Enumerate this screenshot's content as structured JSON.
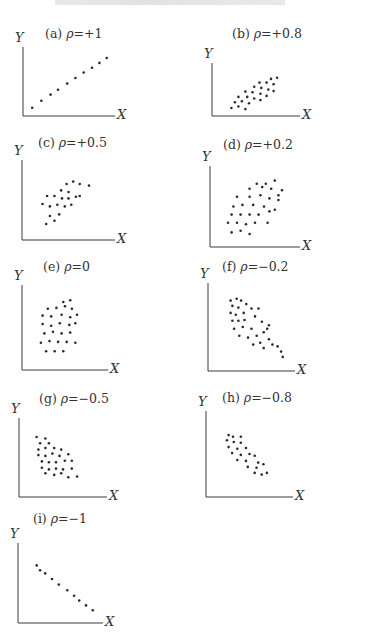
{
  "page": {
    "header_text_visible": false
  },
  "chart_data": [
    {
      "id": "a",
      "type": "scatter",
      "label_prefix": "(a)",
      "rho_symbol": "ρ",
      "rho_value": "=+1",
      "title": "(a) ρ=+1",
      "xlabel": "X",
      "ylabel": "Y",
      "grid": false,
      "ticks": false,
      "layout": {
        "left": 23,
        "top": 47,
        "axisW": 92,
        "axisH": 69,
        "labelX": 45,
        "labelY": 26
      },
      "points": [
        [
          0.1,
          0.12
        ],
        [
          0.2,
          0.22
        ],
        [
          0.3,
          0.31
        ],
        [
          0.38,
          0.38
        ],
        [
          0.48,
          0.47
        ],
        [
          0.57,
          0.55
        ],
        [
          0.66,
          0.63
        ],
        [
          0.75,
          0.7
        ],
        [
          0.83,
          0.77
        ],
        [
          0.91,
          0.84
        ]
      ]
    },
    {
      "id": "b",
      "type": "scatter",
      "label_prefix": "(b)",
      "rho_symbol": "ρ",
      "rho_value": "=+0.8",
      "title": "(b) ρ=+0.8",
      "xlabel": "X",
      "ylabel": "Y",
      "grid": false,
      "ticks": false,
      "layout": {
        "left": 212,
        "top": 63,
        "axisW": 88,
        "axisH": 53,
        "labelX": 232,
        "labelY": 26
      },
      "points": [
        [
          0.22,
          0.15
        ],
        [
          0.3,
          0.18
        ],
        [
          0.38,
          0.13
        ],
        [
          0.26,
          0.26
        ],
        [
          0.34,
          0.28
        ],
        [
          0.42,
          0.24
        ],
        [
          0.3,
          0.36
        ],
        [
          0.4,
          0.36
        ],
        [
          0.48,
          0.33
        ],
        [
          0.55,
          0.3
        ],
        [
          0.38,
          0.46
        ],
        [
          0.46,
          0.45
        ],
        [
          0.55,
          0.42
        ],
        [
          0.62,
          0.38
        ],
        [
          0.48,
          0.55
        ],
        [
          0.56,
          0.53
        ],
        [
          0.64,
          0.5
        ],
        [
          0.7,
          0.47
        ],
        [
          0.54,
          0.63
        ],
        [
          0.62,
          0.63
        ],
        [
          0.7,
          0.6
        ],
        [
          0.67,
          0.7
        ],
        [
          0.74,
          0.72
        ]
      ]
    },
    {
      "id": "c",
      "type": "scatter",
      "label_prefix": "(c)",
      "rho_symbol": "ρ",
      "rho_value": "=+0.5",
      "title": "(c) ρ=+0.5",
      "xlabel": "X",
      "ylabel": "Y",
      "grid": false,
      "ticks": false,
      "layout": {
        "left": 22,
        "top": 160,
        "axisW": 93,
        "axisH": 80,
        "labelX": 38,
        "labelY": 135
      },
      "points": [
        [
          0.26,
          0.2
        ],
        [
          0.35,
          0.24
        ],
        [
          0.3,
          0.3
        ],
        [
          0.4,
          0.32
        ],
        [
          0.22,
          0.45
        ],
        [
          0.3,
          0.42
        ],
        [
          0.38,
          0.44
        ],
        [
          0.46,
          0.42
        ],
        [
          0.53,
          0.44
        ],
        [
          0.27,
          0.55
        ],
        [
          0.35,
          0.55
        ],
        [
          0.43,
          0.52
        ],
        [
          0.5,
          0.52
        ],
        [
          0.58,
          0.54
        ],
        [
          0.42,
          0.62
        ],
        [
          0.5,
          0.6
        ],
        [
          0.62,
          0.55
        ],
        [
          0.48,
          0.7
        ],
        [
          0.55,
          0.73
        ],
        [
          0.62,
          0.7
        ],
        [
          0.72,
          0.68
        ]
      ]
    },
    {
      "id": "d",
      "type": "scatter",
      "label_prefix": "(d)",
      "rho_symbol": "ρ",
      "rho_value": "=+0.2",
      "title": "(d) ρ=+0.2",
      "xlabel": "X",
      "ylabel": "Y",
      "grid": false,
      "ticks": false,
      "layout": {
        "left": 210,
        "top": 166,
        "axisW": 90,
        "axisH": 81,
        "labelX": 223,
        "labelY": 137
      },
      "points": [
        [
          0.24,
          0.18
        ],
        [
          0.34,
          0.2
        ],
        [
          0.44,
          0.16
        ],
        [
          0.2,
          0.3
        ],
        [
          0.3,
          0.3
        ],
        [
          0.4,
          0.28
        ],
        [
          0.5,
          0.3
        ],
        [
          0.64,
          0.3
        ],
        [
          0.24,
          0.4
        ],
        [
          0.34,
          0.4
        ],
        [
          0.44,
          0.4
        ],
        [
          0.54,
          0.4
        ],
        [
          0.66,
          0.44
        ],
        [
          0.26,
          0.5
        ],
        [
          0.36,
          0.52
        ],
        [
          0.48,
          0.52
        ],
        [
          0.6,
          0.5
        ],
        [
          0.72,
          0.46
        ],
        [
          0.3,
          0.62
        ],
        [
          0.44,
          0.62
        ],
        [
          0.56,
          0.64
        ],
        [
          0.66,
          0.6
        ],
        [
          0.76,
          0.58
        ],
        [
          0.44,
          0.72
        ],
        [
          0.58,
          0.74
        ],
        [
          0.68,
          0.72
        ],
        [
          0.76,
          0.64
        ],
        [
          0.52,
          0.78
        ],
        [
          0.62,
          0.78
        ],
        [
          0.72,
          0.82
        ],
        [
          0.8,
          0.7
        ]
      ]
    },
    {
      "id": "e",
      "type": "scatter",
      "label_prefix": "(e)",
      "rho_symbol": "ρ",
      "rho_value": "=0",
      "title": "(e) ρ=0",
      "xlabel": "X",
      "ylabel": "Y",
      "grid": false,
      "ticks": false,
      "layout": {
        "left": 22,
        "top": 285,
        "axisW": 86,
        "axisH": 85,
        "labelX": 43,
        "labelY": 259
      },
      "points": [
        [
          0.28,
          0.22
        ],
        [
          0.38,
          0.22
        ],
        [
          0.48,
          0.22
        ],
        [
          0.22,
          0.32
        ],
        [
          0.32,
          0.34
        ],
        [
          0.42,
          0.33
        ],
        [
          0.52,
          0.33
        ],
        [
          0.62,
          0.32
        ],
        [
          0.26,
          0.43
        ],
        [
          0.36,
          0.45
        ],
        [
          0.46,
          0.43
        ],
        [
          0.56,
          0.44
        ],
        [
          0.24,
          0.54
        ],
        [
          0.34,
          0.52
        ],
        [
          0.44,
          0.55
        ],
        [
          0.55,
          0.53
        ],
        [
          0.62,
          0.55
        ],
        [
          0.24,
          0.64
        ],
        [
          0.34,
          0.63
        ],
        [
          0.46,
          0.65
        ],
        [
          0.56,
          0.62
        ],
        [
          0.64,
          0.65
        ],
        [
          0.3,
          0.72
        ],
        [
          0.4,
          0.73
        ],
        [
          0.5,
          0.75
        ],
        [
          0.58,
          0.72
        ],
        [
          0.48,
          0.8
        ],
        [
          0.56,
          0.82
        ]
      ]
    },
    {
      "id": "f",
      "type": "scatter",
      "label_prefix": "(f)",
      "rho_symbol": "ρ",
      "rho_value": "=−0.2",
      "title": "(f) ρ=−0.2",
      "xlabel": "X",
      "ylabel": "Y",
      "grid": false,
      "ticks": false,
      "layout": {
        "left": 208,
        "top": 283,
        "axisW": 87,
        "axisH": 88,
        "labelX": 222,
        "labelY": 259
      },
      "points": [
        [
          0.26,
          0.8
        ],
        [
          0.33,
          0.82
        ],
        [
          0.38,
          0.8
        ],
        [
          0.28,
          0.74
        ],
        [
          0.35,
          0.72
        ],
        [
          0.44,
          0.76
        ],
        [
          0.26,
          0.66
        ],
        [
          0.32,
          0.64
        ],
        [
          0.41,
          0.66
        ],
        [
          0.5,
          0.71
        ],
        [
          0.58,
          0.71
        ],
        [
          0.28,
          0.57
        ],
        [
          0.35,
          0.57
        ],
        [
          0.42,
          0.58
        ],
        [
          0.54,
          0.62
        ],
        [
          0.3,
          0.48
        ],
        [
          0.4,
          0.5
        ],
        [
          0.5,
          0.48
        ],
        [
          0.62,
          0.56
        ],
        [
          0.7,
          0.52
        ],
        [
          0.36,
          0.4
        ],
        [
          0.46,
          0.38
        ],
        [
          0.56,
          0.4
        ],
        [
          0.64,
          0.44
        ],
        [
          0.68,
          0.48
        ],
        [
          0.6,
          0.32
        ],
        [
          0.7,
          0.36
        ],
        [
          0.52,
          0.3
        ],
        [
          0.64,
          0.26
        ],
        [
          0.74,
          0.3
        ],
        [
          0.8,
          0.28
        ],
        [
          0.84,
          0.22
        ],
        [
          0.86,
          0.16
        ]
      ]
    },
    {
      "id": "g",
      "type": "scatter",
      "label_prefix": "(g)",
      "rho_symbol": "ρ",
      "rho_value": "=−0.5",
      "title": "(g) ρ=−0.5",
      "xlabel": "X",
      "ylabel": "Y",
      "grid": false,
      "ticks": false,
      "layout": {
        "left": 19,
        "top": 418,
        "axisW": 88,
        "axisH": 79,
        "labelX": 39,
        "labelY": 391
      },
      "points": [
        [
          0.2,
          0.76
        ],
        [
          0.3,
          0.74
        ],
        [
          0.24,
          0.68
        ],
        [
          0.34,
          0.68
        ],
        [
          0.22,
          0.6
        ],
        [
          0.3,
          0.62
        ],
        [
          0.4,
          0.62
        ],
        [
          0.48,
          0.6
        ],
        [
          0.22,
          0.53
        ],
        [
          0.3,
          0.52
        ],
        [
          0.38,
          0.55
        ],
        [
          0.46,
          0.52
        ],
        [
          0.56,
          0.54
        ],
        [
          0.26,
          0.45
        ],
        [
          0.34,
          0.44
        ],
        [
          0.42,
          0.44
        ],
        [
          0.52,
          0.46
        ],
        [
          0.6,
          0.46
        ],
        [
          0.26,
          0.37
        ],
        [
          0.34,
          0.35
        ],
        [
          0.42,
          0.36
        ],
        [
          0.5,
          0.35
        ],
        [
          0.6,
          0.36
        ],
        [
          0.3,
          0.3
        ],
        [
          0.4,
          0.28
        ],
        [
          0.48,
          0.3
        ],
        [
          0.56,
          0.25
        ],
        [
          0.66,
          0.26
        ]
      ]
    },
    {
      "id": "h",
      "type": "scatter",
      "label_prefix": "(h)",
      "rho_symbol": "ρ",
      "rho_value": "=−0.8",
      "title": "(h) ρ=−0.8",
      "xlabel": "X",
      "ylabel": "Y",
      "grid": false,
      "ticks": false,
      "layout": {
        "left": 206,
        "top": 411,
        "axisW": 87,
        "axisH": 86,
        "labelX": 222,
        "labelY": 390
      },
      "points": [
        [
          0.26,
          0.72
        ],
        [
          0.31,
          0.7
        ],
        [
          0.4,
          0.7
        ],
        [
          0.24,
          0.66
        ],
        [
          0.32,
          0.64
        ],
        [
          0.4,
          0.63
        ],
        [
          0.26,
          0.58
        ],
        [
          0.36,
          0.56
        ],
        [
          0.46,
          0.57
        ],
        [
          0.3,
          0.51
        ],
        [
          0.4,
          0.49
        ],
        [
          0.5,
          0.5
        ],
        [
          0.56,
          0.48
        ],
        [
          0.36,
          0.43
        ],
        [
          0.46,
          0.42
        ],
        [
          0.6,
          0.4
        ],
        [
          0.48,
          0.35
        ],
        [
          0.58,
          0.34
        ],
        [
          0.66,
          0.38
        ],
        [
          0.56,
          0.28
        ],
        [
          0.64,
          0.26
        ],
        [
          0.7,
          0.28
        ]
      ]
    },
    {
      "id": "i",
      "type": "scatter",
      "label_prefix": "(i)",
      "rho_symbol": "ρ",
      "rho_value": "=−1",
      "title": "(i) ρ=−1",
      "xlabel": "X",
      "ylabel": "Y",
      "grid": false,
      "ticks": false,
      "layout": {
        "left": 18,
        "top": 543,
        "axisW": 85,
        "axisH": 80,
        "labelX": 33,
        "labelY": 511
      },
      "points": [
        [
          0.22,
          0.72
        ],
        [
          0.26,
          0.66
        ],
        [
          0.32,
          0.62
        ],
        [
          0.4,
          0.55
        ],
        [
          0.48,
          0.48
        ],
        [
          0.58,
          0.41
        ],
        [
          0.66,
          0.34
        ],
        [
          0.72,
          0.28
        ],
        [
          0.8,
          0.22
        ],
        [
          0.88,
          0.16
        ]
      ]
    }
  ],
  "style": {
    "axis_color": "#3a3a3a",
    "point_color": "#2c2c2c",
    "label_color": "#333333"
  }
}
